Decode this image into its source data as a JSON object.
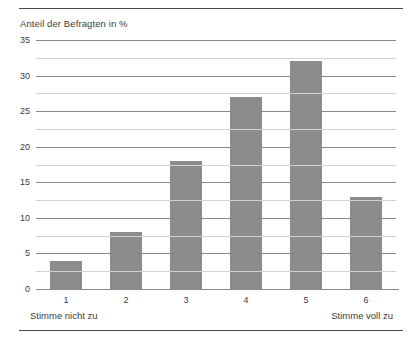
{
  "chart_data": {
    "type": "bar",
    "title": "Anteil der Befragten in %",
    "xlabel": "",
    "ylabel": "Anteil der Befragten in %",
    "categories": [
      "1",
      "2",
      "3",
      "4",
      "5",
      "6"
    ],
    "values": [
      4,
      8,
      18,
      27,
      32,
      13
    ],
    "ylim": [
      0,
      35
    ],
    "yticks": [
      0,
      5,
      10,
      15,
      20,
      25,
      30,
      35
    ],
    "ytick_labels": [
      "0",
      "5",
      "10",
      "15",
      "20",
      "25",
      "30",
      "35"
    ],
    "minor_ticks": [
      2.5,
      7.5,
      12.5,
      17.5,
      22.5,
      27.5,
      32.5
    ],
    "grid": true,
    "legend": null,
    "bar_color": "#8c8c8c",
    "major_gridline_color": "#8a8a8a",
    "minor_gridline_color": "#d2d2d2",
    "rule_color": "#4a4a4a",
    "annotations": {
      "scale_left": "Stimme nicht zu",
      "scale_right": "Stimme voll zu"
    }
  }
}
